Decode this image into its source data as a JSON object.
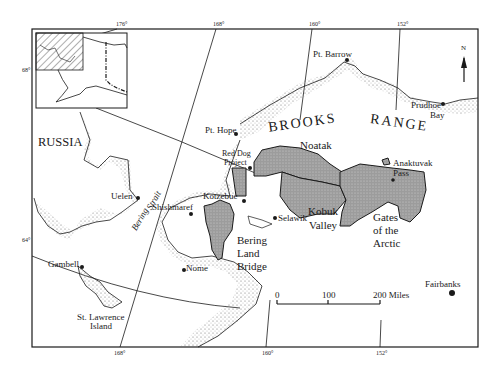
{
  "map": {
    "title": "Northwest Alaska and Bering Strait region",
    "graticule": {
      "longitudes_top": [
        "176°",
        "168°",
        "160°",
        "152°"
      ],
      "longitudes_bottom": [
        "168°",
        "160°",
        "152°"
      ],
      "latitudes": [
        "68°",
        "64°"
      ]
    },
    "regions": {
      "russia": "RUSSIA",
      "brooks": "BROOKS",
      "range": "RANGE"
    },
    "water": {
      "bering_strait_1": "Bering",
      "bering_strait_2": "Strait"
    },
    "places": {
      "pt_barrow": "Pt. Barrow",
      "prudhoe_1": "Prudhoe",
      "prudhoe_2": "Bay",
      "pt_hope": "Pt. Hope",
      "red_dog_1": "Red Dog",
      "red_dog_2": "Project",
      "uelen": "Uelen",
      "shishmaref": "Shishmaref",
      "kotzebue": "Kotzebue",
      "selawik": "Selawik",
      "anaktuvak_1": "Anaktuvak",
      "anaktuvak_2": "Pass",
      "nome": "Nome",
      "gambell": "Gambell",
      "st_lawrence_1": "St. Lawrence",
      "st_lawrence_2": "Island",
      "fairbanks": "Fairbanks"
    },
    "parks": {
      "noatak": "Noatak",
      "kobuk_1": "Kobuk",
      "kobuk_2": "Valley",
      "gates_1": "Gates",
      "gates_2": "of the",
      "gates_3": "Arctic",
      "bering_1": "Bering",
      "bering_2": "Land",
      "bering_3": "Bridge"
    },
    "scale": {
      "tick_0": "0",
      "tick_100": "100",
      "tick_200": "200 Miles"
    },
    "north_arrow": "N",
    "colors": {
      "ink": "#1a1a1a",
      "park_fill": "#a8a8a8",
      "paper": "#ffffff"
    }
  }
}
